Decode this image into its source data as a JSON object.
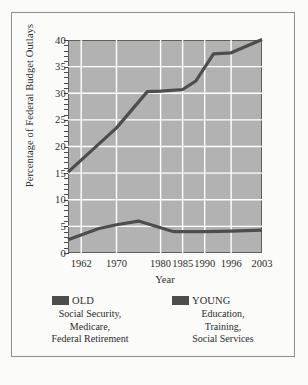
{
  "chart_data": {
    "type": "line",
    "title": "",
    "xlabel": "Year",
    "ylabel": "Percentage of Federal Budget Outlays",
    "x": [
      1962,
      1970,
      1980,
      1985,
      1990,
      1996,
      2003
    ],
    "xtick_labels": [
      "1962",
      "1970",
      "1980",
      "1985",
      "1990",
      "1996",
      "2003"
    ],
    "ytick_labels": [
      "40",
      "35",
      "30",
      "25",
      "20",
      "15",
      "10",
      "5",
      "0"
    ],
    "ytick_values": [
      40,
      35,
      30,
      25,
      20,
      15,
      10,
      5,
      0
    ],
    "ylim": [
      0,
      40
    ],
    "xlim": [
      1959,
      2003
    ],
    "grid": true,
    "legend_position": "below",
    "plot_background": "#b2b2b2",
    "gridline_color": "#ffffff",
    "line_color": "#4d4d4d",
    "series": [
      {
        "name": "OLD",
        "color": "#4d4d4d",
        "points": [
          {
            "x": 1959,
            "y": 15.2
          },
          {
            "x": 1970,
            "y": 23.5
          },
          {
            "x": 1977,
            "y": 30.3
          },
          {
            "x": 1980,
            "y": 30.4
          },
          {
            "x": 1985,
            "y": 30.7
          },
          {
            "x": 1988,
            "y": 32.3
          },
          {
            "x": 1992,
            "y": 37.4
          },
          {
            "x": 1996,
            "y": 37.6
          },
          {
            "x": 2003,
            "y": 40.1
          }
        ]
      },
      {
        "name": "YOUNG",
        "color": "#4d4d4d",
        "points": [
          {
            "x": 1959,
            "y": 2.5
          },
          {
            "x": 1966,
            "y": 4.6
          },
          {
            "x": 1970,
            "y": 5.3
          },
          {
            "x": 1975,
            "y": 6.0
          },
          {
            "x": 1983,
            "y": 4.0
          },
          {
            "x": 1990,
            "y": 4.0
          },
          {
            "x": 1996,
            "y": 4.1
          },
          {
            "x": 2003,
            "y": 4.3
          }
        ]
      }
    ],
    "legend": [
      {
        "key": "old",
        "label": "OLD",
        "swatch_color": "#4d4d4d",
        "description_lines": [
          "Social Security,",
          "Medicare,",
          "Federal Retirement"
        ]
      },
      {
        "key": "young",
        "label": "YOUNG",
        "swatch_color": "#4d4d4d",
        "description_lines": [
          "Education,",
          "Training,",
          "Social Services"
        ]
      }
    ]
  }
}
